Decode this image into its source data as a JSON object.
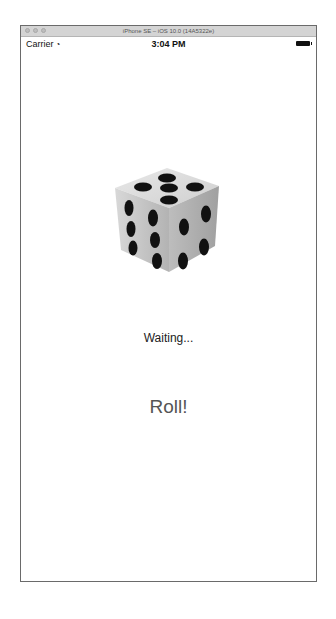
{
  "window": {
    "title": "iPhone SE – iOS 10.0 (14A5322e)"
  },
  "status_bar": {
    "carrier": "Carrier",
    "wifi_icon": "wifi-icon",
    "time": "3:04 PM",
    "battery_icon": "battery-full-icon"
  },
  "main": {
    "dice_image": "dice-icon",
    "status_label": "Waiting...",
    "roll_button_label": "Roll!"
  },
  "colors": {
    "title_bar": "#d4d4d4",
    "frame_border": "#6a6a6a",
    "status_text": "#222222",
    "roll_text": "#555555"
  }
}
